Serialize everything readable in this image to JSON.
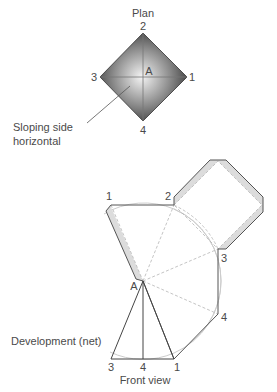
{
  "plan": {
    "title": "Plan",
    "vertex_labels": {
      "top": "2",
      "left": "3",
      "right": "1",
      "bottom": "4"
    },
    "apex_label": "A",
    "annotation_line1": "Sloping side",
    "annotation_line2": "horizontal"
  },
  "development": {
    "title": "Development (net)",
    "labels": {
      "p1_top": "1",
      "p2": "2",
      "p3": "3",
      "p4": "4",
      "apex": "A"
    }
  },
  "front_view": {
    "title": "Front view",
    "base_labels": {
      "left": "3",
      "middle": "4",
      "right": "1"
    }
  },
  "colors": {
    "line": "#555555",
    "dashed": "#bbbbbb",
    "arc": "#cccccc",
    "tab": "#d9d9d9",
    "pyramid_dark": "#3a3a3a",
    "pyramid_light": "#f2f2f2"
  }
}
